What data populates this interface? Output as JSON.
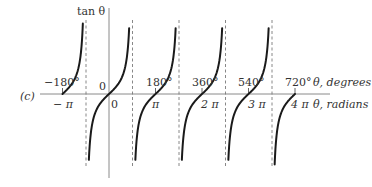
{
  "figure": {
    "panel_label": "(c)",
    "y_axis_label": "tan θ",
    "origin_label": "0",
    "x_axis_degrees_label": "θ, degrees",
    "x_axis_radians_label": "θ, radians",
    "degree_ticks": [
      "−180°",
      "180°",
      "360°",
      "540°",
      "720°"
    ],
    "radian_ticks": [
      "− π",
      "0",
      "π",
      "2 π",
      "3 π",
      "4 π"
    ],
    "colors": {
      "curve": "#1a1a1a",
      "axis": "#8a8a8a",
      "asymptote": "#7a7a7a",
      "text": "#333333"
    }
  },
  "chart_data": {
    "type": "line",
    "title": "",
    "function": "tan(θ)",
    "xlabel_top": "θ, degrees",
    "xlabel_bottom": "θ, radians",
    "ylabel": "tan θ",
    "x_range_radians": [
      -3.1416,
      12.566
    ],
    "x_ticks_degrees": [
      -180,
      180,
      360,
      540,
      720
    ],
    "x_ticks_radians": [
      "-π",
      "0",
      "π",
      "2π",
      "3π",
      "4π"
    ],
    "vertical_asymptotes_degrees": [
      -90,
      90,
      270,
      450,
      630
    ],
    "zero_crossings_degrees": [
      -180,
      0,
      180,
      360,
      540,
      720
    ],
    "grid": false,
    "legend": null,
    "annotations": [
      "(c)"
    ]
  }
}
